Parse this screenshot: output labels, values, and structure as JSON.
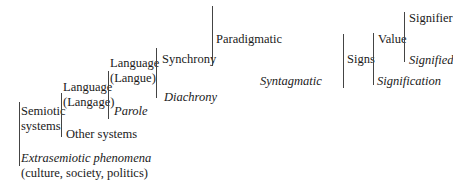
{
  "diagram": {
    "type": "hierarchical-bracket-tree",
    "nodes": {
      "semiotic_systems": {
        "line1": "Semiotic",
        "line2": "systems"
      },
      "extrasemiotic": {
        "line1": "Extrasemiotic phenomena",
        "line2": "(culture, society, politics)"
      },
      "language_langage": {
        "line1": "Language",
        "line2": "(Langage)"
      },
      "other_systems": "Other systems",
      "language_langue": {
        "line1": "Language",
        "line2": "(Langue)"
      },
      "parole": "Parole",
      "synchrony": "Synchrony",
      "diachrony": "Diachrony",
      "paradigmatic": "Paradigmatic",
      "syntagmatic": "Syntagmatic",
      "signs": "Signs",
      "value": "Value",
      "signification": "Signification",
      "signifier": "Signifier",
      "signified": "Signified"
    },
    "edges": [
      {
        "from": "Semiotic systems",
        "upper": "Language (Langage)",
        "lower": "Other systems"
      },
      {
        "from": "(root)",
        "upper": "Semiotic systems",
        "lower": "Extrasemiotic phenomena (culture, society, politics)"
      },
      {
        "from": "Language (Langage)",
        "upper": "Language (Langue)",
        "lower": "Parole"
      },
      {
        "from": "Language (Langue)",
        "upper": "Synchrony",
        "lower": "Diachrony"
      },
      {
        "from": "Synchrony",
        "upper": "Paradigmatic",
        "lower": "Syntagmatic"
      },
      {
        "from": "Syntagmatic",
        "upper": "Signs",
        "lower": null
      },
      {
        "from": "Signs",
        "upper": "Value",
        "lower": "Signification"
      },
      {
        "from": "Value",
        "upper": "Signifier",
        "lower": "Signified"
      }
    ],
    "italic_terms": [
      "Extrasemiotic phenomena",
      "Parole",
      "Diachrony",
      "Syntagmatic",
      "Signification",
      "Signified"
    ]
  }
}
